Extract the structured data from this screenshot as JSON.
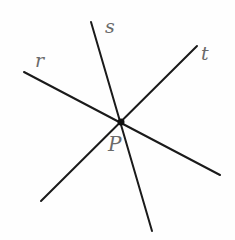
{
  "diagram": {
    "colors": {
      "line": "#1a1a1a",
      "label": "#6a6a6a",
      "point": "#111111",
      "background": "#fefefe"
    },
    "intersection": {
      "label": "P",
      "x": 121,
      "y": 122
    },
    "lines": [
      {
        "name": "r",
        "label": "r",
        "x1": 24,
        "y1": 72,
        "x2": 220,
        "y2": 175,
        "label_x": 35,
        "label_y": 67
      },
      {
        "name": "s",
        "label": "s",
        "x1": 91,
        "y1": 22,
        "x2": 152,
        "y2": 231,
        "label_x": 105,
        "label_y": 33
      },
      {
        "name": "t",
        "label": "t",
        "x1": 197,
        "y1": 46,
        "x2": 41,
        "y2": 201,
        "label_x": 201,
        "label_y": 60
      }
    ],
    "point_label": {
      "text": "P",
      "x": 108,
      "y": 151
    }
  }
}
